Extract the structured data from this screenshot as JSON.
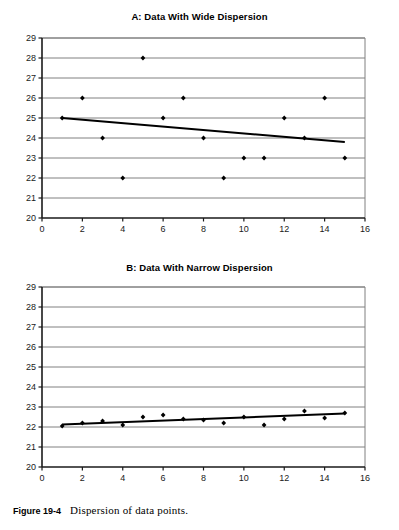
{
  "figure": {
    "caption_label": "Figure 19-4",
    "caption_text": "Dispersion of data points."
  },
  "colors": {
    "axis": "#1a1a1a",
    "gridline": "#808080",
    "marker": "#000000",
    "trendline": "#000000",
    "background": "#ffffff"
  },
  "chart_data": [
    {
      "id": "chart-a",
      "type": "scatter",
      "title": "A: Data With Wide Dispersion",
      "xlabel": "",
      "ylabel": "",
      "xlim": [
        0,
        16
      ],
      "ylim": [
        20,
        29
      ],
      "xticks": [
        0,
        2,
        4,
        6,
        8,
        10,
        12,
        14,
        16
      ],
      "yticks": [
        20,
        21,
        22,
        23,
        24,
        25,
        26,
        27,
        28,
        29
      ],
      "grid": "horizontal",
      "legend": "none",
      "x": [
        1,
        2,
        3,
        4,
        5,
        6,
        7,
        8,
        9,
        10,
        11,
        12,
        13,
        14,
        15
      ],
      "values": [
        25,
        26,
        24,
        22,
        28,
        25,
        26,
        24,
        22,
        23,
        23,
        25,
        24,
        26,
        23
      ],
      "trendline": {
        "x": [
          1,
          15
        ],
        "y": [
          25.0,
          23.8
        ]
      }
    },
    {
      "id": "chart-b",
      "type": "scatter",
      "title": "B: Data With Narrow Dispersion",
      "xlabel": "",
      "ylabel": "",
      "xlim": [
        0,
        16
      ],
      "ylim": [
        20,
        29
      ],
      "xticks": [
        0,
        2,
        4,
        6,
        8,
        10,
        12,
        14,
        16
      ],
      "yticks": [
        20,
        21,
        22,
        23,
        24,
        25,
        26,
        27,
        28,
        29
      ],
      "grid": "horizontal",
      "legend": "none",
      "x": [
        1,
        2,
        3,
        4,
        5,
        6,
        7,
        8,
        9,
        10,
        11,
        12,
        13,
        14,
        15
      ],
      "values": [
        22.05,
        22.2,
        22.3,
        22.1,
        22.5,
        22.6,
        22.4,
        22.35,
        22.2,
        22.5,
        22.1,
        22.4,
        22.8,
        22.45,
        22.7
      ],
      "trendline": {
        "x": [
          1,
          15
        ],
        "y": [
          22.12,
          22.68
        ]
      }
    }
  ]
}
